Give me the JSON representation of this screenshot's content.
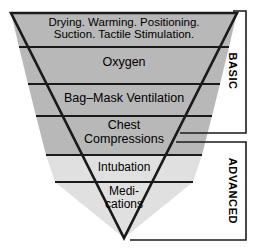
{
  "diagram": {
    "type": "inverted-pyramid-funnel",
    "colors": {
      "band_gray": "#b8b8b8",
      "band_light": "#e0e0e0",
      "outline": "#1a1a1a",
      "divider": "#1a1a1a",
      "text": "#000000",
      "bracket": "#1a1a1a",
      "background": "#ffffff"
    },
    "bands": [
      {
        "id": "band-initial-steps",
        "lines": [
          "Drying. Warming. Positioning.",
          "Suction. Tactile Stimulation."
        ],
        "fill": "gray",
        "group": "BASIC"
      },
      {
        "id": "band-oxygen",
        "lines": [
          "Oxygen"
        ],
        "fill": "gray",
        "group": "BASIC"
      },
      {
        "id": "band-bag-mask-ventilation",
        "lines": [
          "Bag–Mask Ventilation"
        ],
        "fill": "gray",
        "group": "BASIC"
      },
      {
        "id": "band-chest-compressions",
        "lines": [
          "Chest",
          "Compressions"
        ],
        "fill": "gray",
        "group": "BASIC"
      },
      {
        "id": "band-intubation",
        "lines": [
          "Intubation"
        ],
        "fill": "light",
        "group": "ADVANCED"
      },
      {
        "id": "band-medications",
        "lines": [
          "Medi-",
          "cations"
        ],
        "fill": "light",
        "group": "ADVANCED"
      }
    ],
    "brackets": [
      {
        "id": "bracket-basic",
        "label": "BASIC"
      },
      {
        "id": "bracket-advanced",
        "label": "ADVANCED"
      }
    ]
  }
}
